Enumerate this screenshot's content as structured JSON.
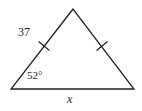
{
  "figure": {
    "type": "geometry-diagram",
    "shape": "isosceles-triangle",
    "background_color": "#ffffff",
    "stroke_color": "#231f20",
    "text_color": "#231f20",
    "vertices": {
      "apex": {
        "x": 73,
        "y": 9
      },
      "bottom_left": {
        "x": 11,
        "y": 89
      },
      "bottom_right": {
        "x": 134,
        "y": 89
      }
    },
    "labels": {
      "left_side": "37",
      "base_angle": "52°",
      "base_side": "x"
    },
    "tick_marks": [
      {
        "name": "left-side-tick",
        "x": 44,
        "y": 46,
        "rotation_deg": 52
      },
      {
        "name": "right-side-tick",
        "x": 102,
        "y": 46,
        "rotation_deg": -52
      }
    ],
    "congruence_note": "single tick on each slanted side"
  }
}
